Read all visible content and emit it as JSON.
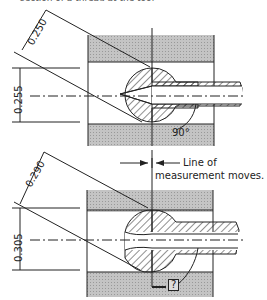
{
  "top_caption": "section of a thread at the tool",
  "upper_figure": {
    "dim_diagonal": "0.250",
    "dim_vertical": "0.255",
    "angle": "90°"
  },
  "lower_figure": {
    "dim_diagonal": "0.290",
    "dim_vertical": "0.305",
    "angle": "?"
  },
  "annotation": {
    "line1": "Line of",
    "line2": "measurement moves."
  },
  "colors": {
    "ink": "#222222",
    "shade": "#b8b8b8"
  }
}
